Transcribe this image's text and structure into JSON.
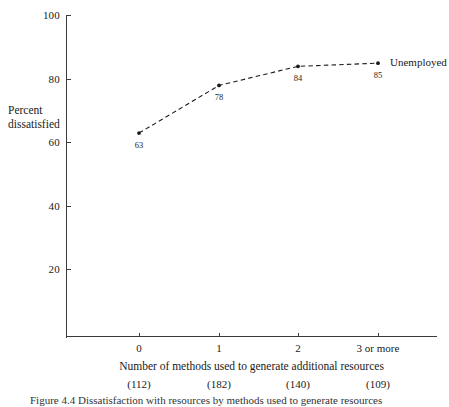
{
  "chart_data": {
    "type": "line",
    "title": "",
    "xlabel": "Number of methods used to generate additional resources",
    "ylabel": "Percent dissatisfied",
    "ylim": [
      0,
      100
    ],
    "yticks": [
      100,
      80,
      60,
      40,
      20
    ],
    "ytick_labels": [
      "100",
      "80",
      "60",
      "40",
      "20"
    ],
    "categories": [
      "0",
      "1",
      "2",
      "3 or more"
    ],
    "sample_sizes": [
      "(112)",
      "(182)",
      "(140)",
      "(109)"
    ],
    "grid": false,
    "legend_position": "right-of-last-point",
    "series": [
      {
        "name": "Unemployed",
        "values": [
          63,
          78,
          84,
          85
        ],
        "value_labels": [
          "63",
          "78",
          "84",
          "85"
        ],
        "line_style": "dashed",
        "marker": "dot",
        "color": "#1a1a1a"
      }
    ]
  },
  "axis": {
    "y_label_line1": "Percent",
    "y_label_line2": "dissatisfied"
  },
  "caption": {
    "text": "Figure 4.4   Dissatisfaction with resources by methods used to generate resources"
  },
  "colors": {
    "axis": "#3a3a3a",
    "series": "#1a1a1a",
    "text": "#1a1a1a"
  }
}
